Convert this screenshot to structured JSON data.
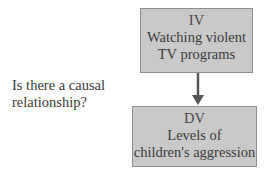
{
  "question": [
    "Is there a causal",
    "relationship?"
  ],
  "iv_box": {
    "label": "IV",
    "lines": [
      "Watching violent",
      "TV programs"
    ]
  },
  "dv_box": {
    "label": "DV",
    "lines": [
      "Levels of",
      "children's aggression"
    ]
  },
  "colors": {
    "box_fill": "#c9c9c9",
    "box_border": "#8f8f8f",
    "arrow": "#555555",
    "text": "#3a3a3a"
  }
}
